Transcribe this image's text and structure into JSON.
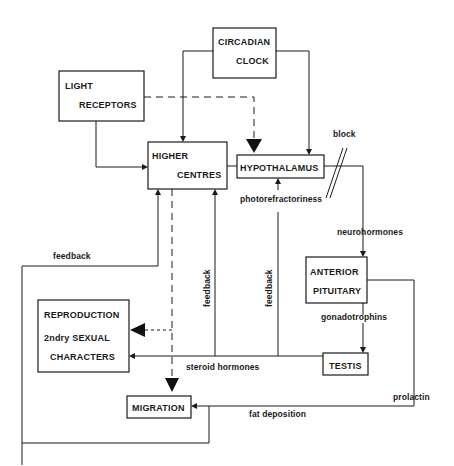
{
  "diagram": {
    "type": "flow-diagram",
    "nodes": {
      "circadian_clock": {
        "line1": "CIRCADIAN",
        "line2": "CLOCK"
      },
      "light_receptors": {
        "line1": "LIGHT",
        "line2": "RECEPTORS"
      },
      "higher_centres": {
        "line1": "HIGHER",
        "line2": "CENTRES"
      },
      "hypothalamus": {
        "line1": "HYPOTHALAMUS"
      },
      "anterior_pituitary": {
        "line1": "ANTERIOR",
        "line2": "PITUITARY"
      },
      "testis": {
        "line1": "TESTIS"
      },
      "reproduction": {
        "line1": "REPRODUCTION",
        "line2": "2ndry SEXUAL",
        "line3": "CHARACTERS"
      },
      "migration": {
        "line1": "MIGRATION"
      }
    },
    "edge_labels": {
      "block": "block",
      "photorefractoriness": "photorefractoriness",
      "neurohormones": "neurohormones",
      "gonadotrophins": "gonadotrophins",
      "steroid_hormones": "steroid  hormones",
      "fat_deposition": "fat deposition",
      "prolactin": "prolactin",
      "feedback_left": "feedback",
      "feedback_mid": "feedback",
      "feedback_right": "feedback"
    },
    "edges": [
      {
        "from": "circadian_clock",
        "to": "higher_centres",
        "style": "solid"
      },
      {
        "from": "circadian_clock",
        "to": "hypothalamus",
        "style": "solid"
      },
      {
        "from": "light_receptors",
        "to": "higher_centres",
        "style": "solid"
      },
      {
        "from": "light_receptors",
        "to": "hypothalamus",
        "style": "dashed"
      },
      {
        "from": "higher_centres",
        "to": "hypothalamus",
        "style": "solid"
      },
      {
        "from": "hypothalamus",
        "to": "anterior_pituitary",
        "style": "solid",
        "label": "neurohormones",
        "note": "block"
      },
      {
        "from": "anterior_pituitary",
        "to": "testis",
        "style": "solid",
        "label": "gonadotrophins"
      },
      {
        "from": "testis",
        "to": "reproduction",
        "style": "solid",
        "label": "steroid hormones"
      },
      {
        "from": "testis",
        "to": "higher_centres",
        "style": "solid",
        "label": "feedback"
      },
      {
        "from": "testis",
        "to": "hypothalamus",
        "style": "solid",
        "label": "feedback / photorefractoriness"
      },
      {
        "from": "higher_centres",
        "to": "migration",
        "style": "dashed"
      },
      {
        "from": "higher_centres",
        "to": "reproduction",
        "style": "dashed"
      },
      {
        "from": "anterior_pituitary",
        "to": "migration",
        "style": "solid",
        "label": "prolactin / fat deposition"
      },
      {
        "from": "migration",
        "to": "higher_centres",
        "style": "solid",
        "label": "feedback"
      }
    ]
  }
}
